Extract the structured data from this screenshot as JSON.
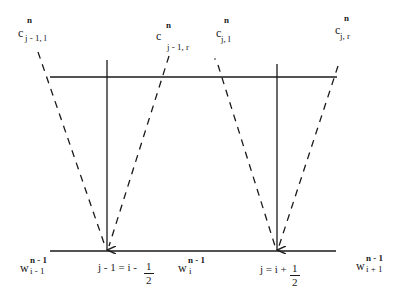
{
  "diagram": {
    "type": "characteristic-stencil",
    "colors": {
      "ink": "#1a1a1a",
      "background": "#ffffff"
    },
    "top_labels": [
      {
        "base": "c",
        "sup": "n",
        "sub": "j - 1, l"
      },
      {
        "base": "c",
        "sup": "n",
        "sub": "j - 1, r"
      },
      {
        "base": "c",
        "sup": "n",
        "sub": "j, l"
      },
      {
        "base": "c",
        "sup": "n",
        "sub": "j, r"
      }
    ],
    "bottom_labels": [
      {
        "base": "w",
        "sup": "n - 1",
        "sub": "i - 1"
      },
      {
        "base": "w",
        "sup": "n - 1",
        "sub": "i"
      },
      {
        "base": "w",
        "sup": "n - 1",
        "sub": "i + 1"
      }
    ],
    "interface_labels": [
      {
        "lhs": "j - 1 = i -",
        "num": "1",
        "den": "2"
      },
      {
        "lhs": "j = i +",
        "num": "1",
        "den": "2"
      }
    ],
    "lines": {
      "top_level": {
        "x1": 50,
        "y1": 77,
        "x2": 337,
        "y2": 77
      },
      "bottom_level": {
        "x1": 50,
        "y1": 251,
        "x2": 336,
        "y2": 251
      }
    }
  }
}
